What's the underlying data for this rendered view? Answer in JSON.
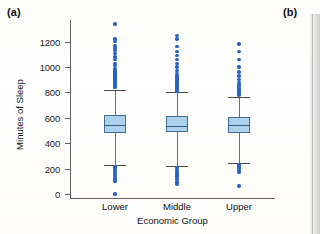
{
  "figure": {
    "panel_a_label": "(a)",
    "panel_b_label": "(b)"
  },
  "chart_data": {
    "type": "box",
    "title": "",
    "xlabel": "Economic Group",
    "ylabel": "Minutes of Sleep",
    "categories": [
      "Lower",
      "Middle",
      "Upper"
    ],
    "ylim": [
      -30,
      1370
    ],
    "yticks": [
      0,
      200,
      400,
      600,
      800,
      1000,
      1200
    ],
    "ytick_labels": [
      "0",
      "200",
      "400",
      "600",
      "800",
      "1000",
      "1200"
    ],
    "grid": false,
    "legend": "none",
    "box_color": "#aed2ec",
    "box_edge_color": "#3f6f96",
    "outlier_color": "#2a63c7",
    "boxes": [
      {
        "category": "Lower",
        "whisker_low": 230,
        "q1": 480,
        "median": 545,
        "q3": 620,
        "whisker_high": 820,
        "outliers_high": [
          840,
          850,
          860,
          870,
          880,
          890,
          900,
          905,
          910,
          915,
          920,
          925,
          930,
          935,
          940,
          945,
          950,
          960,
          975,
          990,
          1010,
          1030,
          1060,
          1080,
          1105,
          1130,
          1150,
          1170,
          1200,
          1220,
          1340
        ],
        "outliers_low": [
          215,
          200,
          185,
          170,
          155,
          140,
          125,
          110,
          100,
          0
        ]
      },
      {
        "category": "Middle",
        "whisker_low": 225,
        "q1": 490,
        "median": 540,
        "q3": 615,
        "whisker_high": 800,
        "outliers_high": [
          810,
          820,
          830,
          840,
          850,
          860,
          870,
          880,
          890,
          900,
          915,
          930,
          950,
          975,
          1000,
          1030,
          1060,
          1090,
          1120,
          1160,
          1220,
          1250
        ],
        "outliers_low": [
          210,
          195,
          180,
          165,
          150,
          140,
          120,
          95,
          80
        ]
      },
      {
        "category": "Upper",
        "whisker_low": 245,
        "q1": 480,
        "median": 545,
        "q3": 610,
        "whisker_high": 765,
        "outliers_high": [
          780,
          790,
          800,
          810,
          820,
          830,
          845,
          860,
          880,
          900,
          930,
          960,
          1000,
          1060,
          1120,
          1180
        ],
        "outliers_low": [
          230,
          215,
          200,
          185,
          170,
          65
        ]
      }
    ]
  }
}
